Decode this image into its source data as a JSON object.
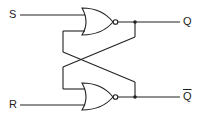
{
  "diagram": {
    "inputs": {
      "set": "S",
      "reset": "R"
    },
    "outputs": {
      "q": "Q",
      "q_bar": "Q"
    },
    "gates": [
      {
        "id": "nor-top",
        "type": "NOR",
        "inputs": [
          "S",
          "Q̄ feedback"
        ],
        "output": "Q"
      },
      {
        "id": "nor-bottom",
        "type": "NOR",
        "inputs": [
          "Q feedback",
          "R"
        ],
        "output": "Q̄"
      }
    ],
    "colors": {
      "line": "#222222",
      "background": "#ffffff"
    }
  }
}
